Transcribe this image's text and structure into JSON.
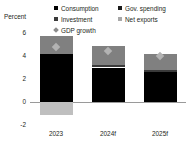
{
  "chart_data": {
    "type": "bar",
    "title": "",
    "subtitle": "",
    "xlabel": "",
    "ylabel": "Percent",
    "categories": [
      "2023",
      "2024f",
      "2025f"
    ],
    "ylim": [
      -2,
      6
    ],
    "yticks": [
      "6",
      "4",
      "2",
      "0",
      "-2"
    ],
    "ytick_values": [
      6,
      4,
      2,
      0,
      -2
    ],
    "grid": false,
    "stacked": true,
    "legend_position": "top",
    "series": [
      {
        "name": "Consumption",
        "values": [
          4.2,
          3.0,
          2.6
        ],
        "color": "#000000"
      },
      {
        "name": "Investment",
        "values": [
          0.0,
          0.2,
          0.2
        ],
        "color": "#3a3a3a"
      },
      {
        "name": "Gov. spending",
        "values": [
          1.5,
          1.7,
          1.4
        ],
        "color": "#808080"
      },
      {
        "name": "Net exports",
        "values": [
          -1.1,
          0.0,
          0.0
        ],
        "color": "#bfbfbf"
      }
    ],
    "markers": {
      "name": "GDP growth",
      "values": [
        4.8,
        4.4,
        4.0
      ],
      "color": "#b3b3b3",
      "shape": "diamond"
    },
    "bar_totals": [
      5.7,
      4.9,
      4.2
    ],
    "annotations": []
  },
  "legend": {
    "columns": [
      {
        "items": [
          {
            "label": "Consumption",
            "marker": "square-marker-black",
            "color": "#000000",
            "shape": "square"
          },
          {
            "label": "Investment",
            "marker": "square-marker-darkgray",
            "color": "#3a3a3a",
            "shape": "square"
          },
          {
            "label": "GDP growth",
            "marker": "diamond-marker-gray",
            "color": "#8c8c8c",
            "shape": "diamond"
          }
        ]
      },
      {
        "items": [
          {
            "label": "Gov. spending",
            "marker": "square-marker-gray",
            "color": "#1a1a1a",
            "shape": "square"
          },
          {
            "label": "Net exports",
            "marker": "square-marker-lightgray",
            "color": "#a8a8a8",
            "shape": "square"
          }
        ]
      }
    ]
  }
}
